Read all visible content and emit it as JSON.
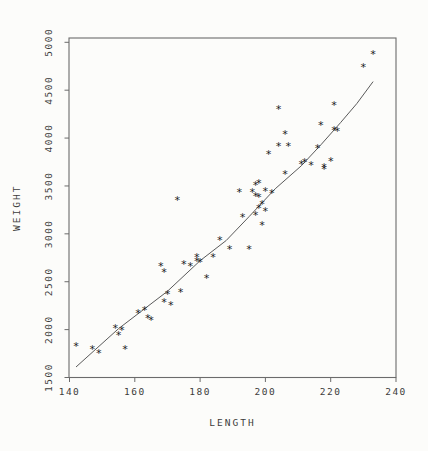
{
  "chart_data": {
    "type": "scatter",
    "title": "",
    "xlabel": "LENGTH",
    "ylabel": "WEIGHT",
    "xlim": [
      140,
      240
    ],
    "ylim": [
      1500,
      5000
    ],
    "x_ticks": [
      140,
      160,
      180,
      200,
      220,
      240
    ],
    "y_ticks": [
      1500,
      2000,
      2500,
      3000,
      3500,
      4000,
      4500,
      5000
    ],
    "grid": false,
    "frame": "box",
    "legend": "none",
    "marker_glyph": "*",
    "series": [
      {
        "name": "observations",
        "type": "scatter",
        "points": [
          [
            142,
            1820
          ],
          [
            147,
            1790
          ],
          [
            149,
            1750
          ],
          [
            154,
            2010
          ],
          [
            155,
            1940
          ],
          [
            156,
            1990
          ],
          [
            157,
            1790
          ],
          [
            161,
            2170
          ],
          [
            163,
            2200
          ],
          [
            164,
            2110
          ],
          [
            165,
            2090
          ],
          [
            168,
            2660
          ],
          [
            169,
            2600
          ],
          [
            169,
            2280
          ],
          [
            170,
            2370
          ],
          [
            171,
            2250
          ],
          [
            173,
            3350
          ],
          [
            174,
            2390
          ],
          [
            175,
            2680
          ],
          [
            177,
            2660
          ],
          [
            179,
            2750
          ],
          [
            179,
            2710
          ],
          [
            180,
            2700
          ],
          [
            182,
            2530
          ],
          [
            184,
            2750
          ],
          [
            186,
            2930
          ],
          [
            189,
            2840
          ],
          [
            192,
            3430
          ],
          [
            193,
            3170
          ],
          [
            195,
            2840
          ],
          [
            196,
            3430
          ],
          [
            197,
            3500
          ],
          [
            197,
            3390
          ],
          [
            197,
            3190
          ],
          [
            198,
            3520
          ],
          [
            198,
            3380
          ],
          [
            198,
            3260
          ],
          [
            199,
            3310
          ],
          [
            199,
            3090
          ],
          [
            200,
            3440
          ],
          [
            200,
            3230
          ],
          [
            201,
            3830
          ],
          [
            202,
            3420
          ],
          [
            204,
            4300
          ],
          [
            204,
            3910
          ],
          [
            206,
            4040
          ],
          [
            206,
            3620
          ],
          [
            207,
            3910
          ],
          [
            211,
            3720
          ],
          [
            212,
            3740
          ],
          [
            214,
            3710
          ],
          [
            216,
            3890
          ],
          [
            217,
            4130
          ],
          [
            218,
            3690
          ],
          [
            218,
            3670
          ],
          [
            220,
            3750
          ],
          [
            221,
            4340
          ],
          [
            221,
            4080
          ],
          [
            222,
            4070
          ],
          [
            230,
            4740
          ],
          [
            233,
            4870
          ]
        ]
      },
      {
        "name": "fit-line",
        "type": "line",
        "points": [
          [
            142,
            1610
          ],
          [
            155,
            2010
          ],
          [
            170,
            2400
          ],
          [
            180,
            2720
          ],
          [
            188,
            2930
          ],
          [
            195,
            3180
          ],
          [
            203,
            3470
          ],
          [
            211,
            3710
          ],
          [
            217,
            3930
          ],
          [
            223,
            4160
          ],
          [
            228,
            4360
          ],
          [
            233,
            4590
          ]
        ]
      }
    ],
    "colors": {
      "marker": "#1c1c1c",
      "line": "#5a5a5a",
      "axis": "#6b6b6b",
      "text": "#3c3c3c",
      "background": "#fcfcfa"
    }
  }
}
